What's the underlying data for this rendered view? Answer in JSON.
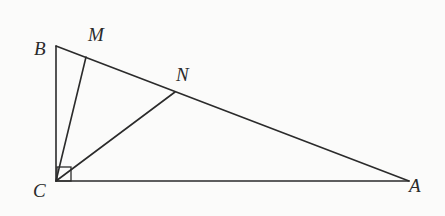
{
  "figure": {
    "type": "geometry",
    "points": {
      "A": {
        "label": "A",
        "x": 409,
        "y": 181
      },
      "B": {
        "label": "B",
        "x": 56,
        "y": 46
      },
      "C": {
        "label": "C",
        "x": 56,
        "y": 181
      },
      "M": {
        "label": "M",
        "x": 86,
        "y": 57
      },
      "N": {
        "label": "N",
        "x": 175,
        "y": 92
      }
    },
    "segments": [
      [
        "B",
        "C"
      ],
      [
        "C",
        "A"
      ],
      [
        "B",
        "A"
      ],
      [
        "C",
        "M"
      ],
      [
        "C",
        "N"
      ]
    ],
    "right_angle_at": "C",
    "labels": {
      "A": "A",
      "B": "B",
      "C": "C",
      "M": "M",
      "N": "N"
    },
    "colors": {
      "stroke": "#2b2b2b",
      "background": "#fbfbfa"
    }
  }
}
